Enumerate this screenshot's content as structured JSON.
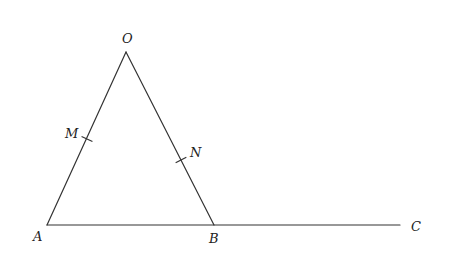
{
  "diagram": {
    "type": "geometry",
    "points": {
      "O": {
        "label": "O",
        "x": 126,
        "y": 52,
        "label_x": 122,
        "label_y": 43
      },
      "A": {
        "label": "A",
        "x": 47,
        "y": 225,
        "label_x": 33,
        "label_y": 241
      },
      "B": {
        "label": "B",
        "x": 214,
        "y": 225,
        "label_x": 209,
        "label_y": 243
      },
      "C": {
        "label": "C",
        "x": 400,
        "y": 225,
        "label_x": 411,
        "label_y": 231
      },
      "M": {
        "label": "M",
        "x": 87,
        "y": 139,
        "label_x": 65,
        "label_y": 138
      },
      "N": {
        "label": "N",
        "x": 181,
        "y": 160,
        "label_x": 190,
        "label_y": 157
      }
    },
    "segments": [
      {
        "from": "O",
        "to": "A"
      },
      {
        "from": "O",
        "to": "B"
      },
      {
        "from": "A",
        "to": "C"
      }
    ],
    "tick_marks": [
      "M",
      "N"
    ],
    "colors": {
      "line": "#333333",
      "text": "#222222",
      "background": "#ffffff"
    }
  }
}
